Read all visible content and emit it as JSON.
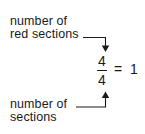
{
  "diagram": {
    "top_label": {
      "line1": "number of",
      "line2": "red sections"
    },
    "bottom_label": {
      "line1": "number of",
      "line2": "sections"
    },
    "equation": {
      "numerator": "4",
      "denominator": "4",
      "equals": "=",
      "result": "1"
    },
    "colors": {
      "ink": "#1a1a1a",
      "background": "#ffffff"
    }
  }
}
